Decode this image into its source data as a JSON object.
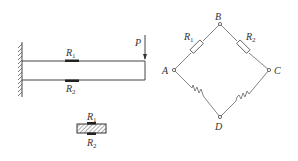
{
  "figure": {
    "beam": {
      "load_label": "P",
      "gauge_top": {
        "letter": "R",
        "sub": "1"
      },
      "gauge_bottom": {
        "letter": "R",
        "sub": "2"
      }
    },
    "cross_section": {
      "gauge_top": {
        "letter": "R",
        "sub": "1"
      },
      "gauge_bottom": {
        "letter": "R",
        "sub": "2"
      }
    },
    "bridge": {
      "nodes": {
        "A": "A",
        "B": "B",
        "C": "C",
        "D": "D"
      },
      "arm_AB": {
        "letter": "R",
        "sub": "1"
      },
      "arm_BC": {
        "letter": "R",
        "sub": "2"
      }
    }
  }
}
